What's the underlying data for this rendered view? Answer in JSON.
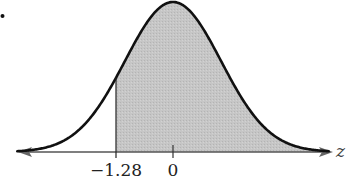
{
  "chart_data": {
    "type": "area",
    "title": "",
    "distribution": "standard normal",
    "mean": 0,
    "std_dev": 1,
    "xlabel": "z",
    "ylabel": "",
    "tick_labels": [
      "−1.28",
      "0"
    ],
    "tick_values": [
      -1.28,
      0
    ],
    "shaded_region": {
      "from": -1.28,
      "to": "+infinity",
      "side": "right"
    },
    "xlim": [
      -3.5,
      3.5
    ],
    "grid": false,
    "legend": null
  },
  "colors": {
    "curve": "#111111",
    "shade": "#c4c4c4",
    "axis": "#555555",
    "background": "#ffffff"
  },
  "labels": {
    "left_tick": "−1.28",
    "center_tick": "0",
    "axis_var": "z"
  }
}
